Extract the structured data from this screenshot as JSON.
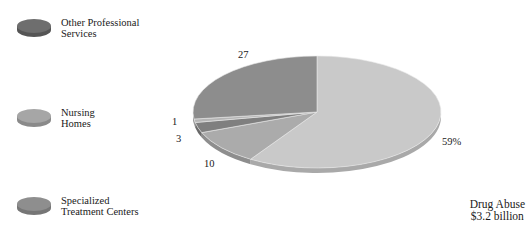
{
  "chart_data": {
    "type": "pie",
    "title": "Drug Abuse",
    "subtitle": "$3.2 billion",
    "slices": [
      {
        "value": 59,
        "label": "59%",
        "color": "#c9c9c9",
        "side": "#a9a9a9"
      },
      {
        "value": 10,
        "label": "10",
        "color": "#ababab",
        "side": "#8e8e8e"
      },
      {
        "value": 3,
        "label": "3",
        "color": "#7f7f7f",
        "side": "#6a6a6a"
      },
      {
        "value": 1,
        "label": "1",
        "color": "#b5b5b5",
        "side": "#9a9a9a"
      },
      {
        "value": 27,
        "label": "27",
        "color": "#8d8d8d",
        "side": "#777777"
      }
    ],
    "legend": [
      {
        "label": "Other Professional Services",
        "color": "#6e6e6e"
      },
      {
        "label": "Nursing Homes",
        "color": "#a6a6a6"
      },
      {
        "label": "Specialized Treatment Centers",
        "color": "#8e8e8e"
      }
    ],
    "legend_position": "left",
    "grid": false
  },
  "legend": {
    "items": [
      {
        "line1": "Other Professional",
        "line2": "Services"
      },
      {
        "line1": "Nursing",
        "line2": "Homes"
      },
      {
        "line1": "Specialized",
        "line2": "Treatment Centers"
      }
    ]
  },
  "labels": {
    "l59": "59%",
    "l27": "27",
    "l10": "10",
    "l3": "3",
    "l1": "1"
  },
  "caption": {
    "line1": "Drug Abuse",
    "line2": "$3.2 billion"
  }
}
